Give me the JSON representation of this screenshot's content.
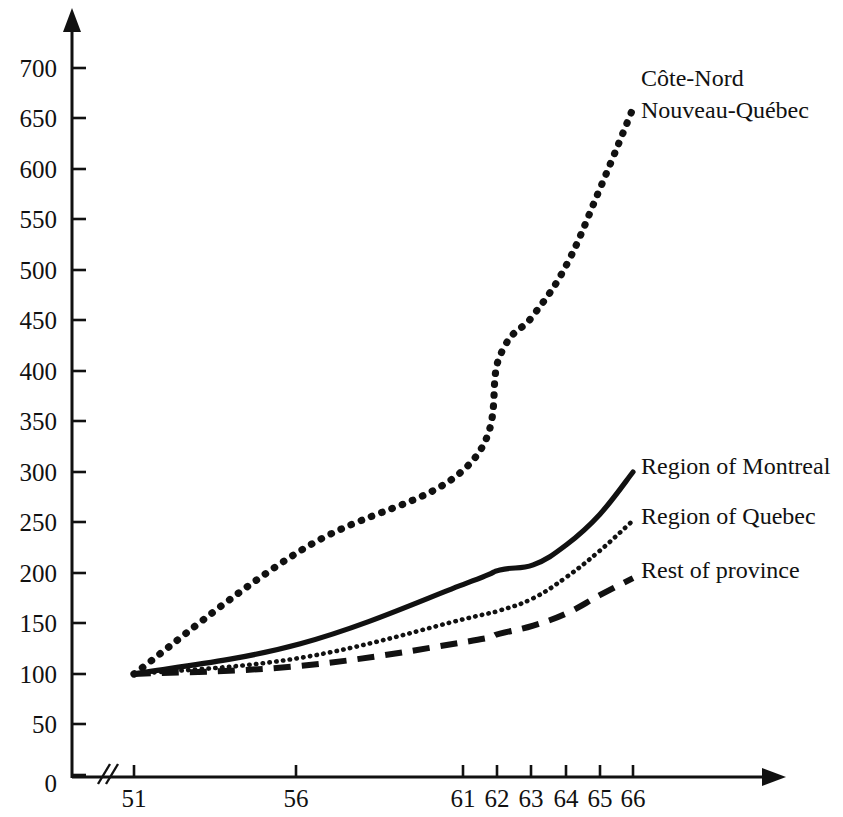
{
  "chart_data": {
    "type": "line",
    "title": "",
    "subtitle": "",
    "xlabel": "",
    "ylabel": "",
    "xlim": [
      51,
      66
    ],
    "ylim": [
      0,
      730
    ],
    "grid": false,
    "legend_position": "inline-right-of-line-ends",
    "axis_break_x": true,
    "y_ticks": [
      0,
      50,
      100,
      150,
      200,
      250,
      300,
      350,
      400,
      450,
      500,
      550,
      600,
      650,
      700
    ],
    "y_tick_labels": [
      "0",
      "50",
      "100",
      "150",
      "200",
      "250",
      "300",
      "350",
      "400",
      "450",
      "500",
      "550",
      "600",
      "650",
      "700"
    ],
    "x_ticks": [
      51,
      56,
      61,
      62,
      63,
      64,
      65,
      66
    ],
    "x_tick_labels": [
      "51",
      "56",
      "61",
      "62",
      "63",
      "64",
      "65",
      "66"
    ],
    "x": [
      51,
      56,
      61,
      62,
      63,
      64,
      65,
      66
    ],
    "series": [
      {
        "name": "Côte-Nord\nNouveau-Québec",
        "label_line1": "Côte-Nord",
        "label_line2": "Nouveau-Québec",
        "style": "coarse-dotted",
        "color": "#111111",
        "values": [
          100,
          222,
          305,
          415,
          455,
          505,
          580,
          660
        ]
      },
      {
        "name": "Region of Montreal",
        "label_line1": "Region of Montreal",
        "label_line2": "",
        "style": "solid",
        "color": "#111111",
        "values": [
          100,
          130,
          190,
          203,
          208,
          228,
          258,
          300
        ]
      },
      {
        "name": "Region of Quebec",
        "label_line1": "Region of Quebec",
        "label_line2": "",
        "style": "fine-dotted",
        "color": "#111111",
        "values": [
          100,
          116,
          155,
          163,
          175,
          196,
          222,
          252
        ]
      },
      {
        "name": "Rest of province",
        "label_line1": "Rest of province",
        "label_line2": "",
        "style": "dashed",
        "color": "#111111",
        "values": [
          100,
          108,
          132,
          140,
          148,
          160,
          178,
          195
        ]
      }
    ]
  },
  "labels": {
    "cote_nord_line1": "Côte-Nord",
    "cote_nord_line2": "Nouveau-Québec",
    "montreal": "Region of Montreal",
    "quebec": "Region of Quebec",
    "rest": "Rest of province"
  },
  "y_axis": {
    "t0": "0",
    "t1": "50",
    "t2": "100",
    "t3": "150",
    "t4": "200",
    "t5": "250",
    "t6": "300",
    "t7": "350",
    "t8": "400",
    "t9": "450",
    "t10": "500",
    "t11": "550",
    "t12": "600",
    "t13": "650",
    "t14": "700"
  },
  "x_axis": {
    "t0": "51",
    "t1": "56",
    "t2": "61",
    "t3": "62",
    "t4": "63",
    "t5": "64",
    "t6": "65",
    "t7": "66"
  },
  "colors": {
    "ink": "#111111",
    "paper": "#ffffff"
  }
}
